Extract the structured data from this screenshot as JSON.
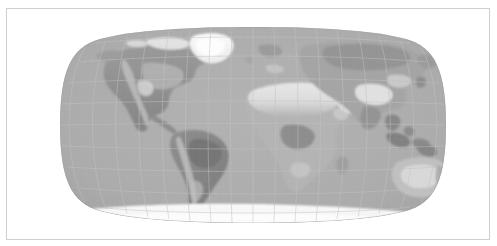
{
  "window": {
    "background_color": "#ffffff",
    "frame_color": "#cfcfcf",
    "width": 497,
    "height": 246
  },
  "map": {
    "name": "world-map",
    "title": "",
    "projection": "Robinson",
    "style": "grayscale shaded relief / land cover",
    "colors": {
      "ocean": "#aeaeae",
      "ocean_shade_dark": "#a2a2a2",
      "graticule": "#bcbcbc",
      "land_base": "#a8a8a8",
      "land_dark": "#8a8a8a",
      "land_darkest": "#757575",
      "land_light": "#cfcfcf",
      "desert": "#e2e2e2",
      "ice": "#f4f4f4",
      "outline": "#9a9a9a"
    },
    "graticule": {
      "visible": true,
      "meridian_interval_degrees": 20,
      "parallel_interval_degrees": 20,
      "central_meridian": 0
    },
    "extent": {
      "left_px": 53,
      "top_px": 18,
      "right_px": 443,
      "bottom_px": 228
    },
    "features": [
      {
        "name": "north-america",
        "label": "North America",
        "tone": "dark"
      },
      {
        "name": "greenland",
        "label": "Greenland",
        "tone": "ice"
      },
      {
        "name": "south-america",
        "label": "South America",
        "tone": "dark"
      },
      {
        "name": "africa",
        "label": "Africa",
        "tone": "mixed"
      },
      {
        "name": "sahara",
        "label": "Sahara",
        "tone": "desert"
      },
      {
        "name": "europe",
        "label": "Europe",
        "tone": "mid"
      },
      {
        "name": "asia",
        "label": "Asia",
        "tone": "mixed"
      },
      {
        "name": "tibetan-plateau",
        "label": "Tibetan Plateau",
        "tone": "light"
      },
      {
        "name": "arabian-peninsula",
        "label": "Arabian Peninsula",
        "tone": "desert"
      },
      {
        "name": "australia",
        "label": "Australia",
        "tone": "light"
      },
      {
        "name": "antarctica",
        "label": "Antarctica",
        "tone": "ice"
      },
      {
        "name": "madagascar",
        "label": "Madagascar",
        "tone": "mid"
      },
      {
        "name": "new-zealand",
        "label": "New Zealand",
        "tone": "mid"
      },
      {
        "name": "japan",
        "label": "Japan",
        "tone": "mid"
      },
      {
        "name": "indonesia",
        "label": "Indonesia",
        "tone": "dark"
      }
    ]
  }
}
